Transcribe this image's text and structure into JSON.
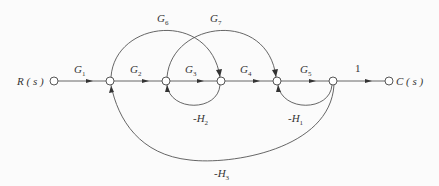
{
  "diagram": {
    "type": "signal-flow-graph",
    "input": "R ( s )",
    "output": "C ( s )",
    "nodes": [
      {
        "id": "R",
        "x": 54,
        "y": 81
      },
      {
        "id": "n1",
        "x": 110,
        "y": 81
      },
      {
        "id": "n2",
        "x": 166,
        "y": 81
      },
      {
        "id": "n3",
        "x": 221,
        "y": 81
      },
      {
        "id": "n4",
        "x": 277,
        "y": 81
      },
      {
        "id": "n5",
        "x": 333,
        "y": 81
      },
      {
        "id": "C",
        "x": 389,
        "y": 81
      }
    ],
    "forward_branches": [
      {
        "from": "R",
        "to": "n1",
        "gain": "G1",
        "base": "G",
        "sub": "1"
      },
      {
        "from": "n1",
        "to": "n2",
        "gain": "G2",
        "base": "G",
        "sub": "2"
      },
      {
        "from": "n2",
        "to": "n3",
        "gain": "G3",
        "base": "G",
        "sub": "3"
      },
      {
        "from": "n3",
        "to": "n4",
        "gain": "G4",
        "base": "G",
        "sub": "4"
      },
      {
        "from": "n4",
        "to": "n5",
        "gain": "G5",
        "base": "G",
        "sub": "5"
      },
      {
        "from": "n5",
        "to": "C",
        "gain": "1"
      }
    ],
    "feedforward_branches": [
      {
        "from": "n1",
        "to": "n3",
        "gain": "G6",
        "base": "G",
        "sub": "6"
      },
      {
        "from": "n2",
        "to": "n4",
        "gain": "G7",
        "base": "G",
        "sub": "7"
      }
    ],
    "feedback_branches": [
      {
        "from": "n3",
        "to": "n2",
        "gain": "-H2",
        "base": "-H",
        "sub": "2"
      },
      {
        "from": "n5",
        "to": "n4",
        "gain": "-H1",
        "base": "-H",
        "sub": "1"
      },
      {
        "from": "n5",
        "to": "n1",
        "gain": "-H3",
        "base": "-H",
        "sub": "3"
      }
    ],
    "line_color": "#444444"
  }
}
